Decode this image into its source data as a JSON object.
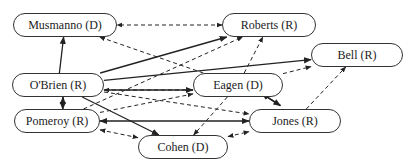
{
  "diagram": {
    "nodes": [
      {
        "id": "musmanno",
        "label": "Musmanno (D)",
        "x": 13,
        "y": 13,
        "w": 104,
        "h": 24
      },
      {
        "id": "roberts",
        "label": "Roberts (R)",
        "x": 222,
        "y": 13,
        "w": 94,
        "h": 24
      },
      {
        "id": "bell",
        "label": "Bell (R)",
        "x": 311,
        "y": 43,
        "w": 92,
        "h": 24
      },
      {
        "id": "obrien",
        "label": "O'Brien (R)",
        "x": 12,
        "y": 73,
        "w": 92,
        "h": 24
      },
      {
        "id": "eagen",
        "label": "Eagen (D)",
        "x": 193,
        "y": 73,
        "w": 90,
        "h": 24
      },
      {
        "id": "pomeroy",
        "label": "Pomeroy (R)",
        "x": 14,
        "y": 109,
        "w": 86,
        "h": 24
      },
      {
        "id": "jones",
        "label": "Jones (R)",
        "x": 249,
        "y": 109,
        "w": 92,
        "h": 24
      },
      {
        "id": "cohen",
        "label": "Cohen (D)",
        "x": 138,
        "y": 135,
        "w": 90,
        "h": 24
      }
    ],
    "edges": [
      {
        "from": "obrien",
        "to": "musmanno",
        "style": "solid",
        "dir": "forward"
      },
      {
        "from": "roberts",
        "to": "musmanno",
        "style": "dashed",
        "dir": "both"
      },
      {
        "from": "eagen",
        "to": "musmanno",
        "style": "dashed",
        "dir": "forward"
      },
      {
        "from": "obrien",
        "to": "roberts",
        "style": "solid",
        "dir": "forward"
      },
      {
        "from": "obrien",
        "to": "bell",
        "style": "solid",
        "dir": "forward"
      },
      {
        "from": "obrien",
        "to": "eagen",
        "style": "solid",
        "dir": "forward"
      },
      {
        "from": "eagen",
        "to": "obrien",
        "style": "dashed",
        "dir": "forward"
      },
      {
        "from": "obrien",
        "to": "pomeroy",
        "style": "solid",
        "dir": "forward"
      },
      {
        "from": "pomeroy",
        "to": "obrien",
        "style": "solid",
        "dir": "forward"
      },
      {
        "from": "obrien",
        "to": "cohen",
        "style": "solid",
        "dir": "forward"
      },
      {
        "from": "obrien",
        "to": "jones",
        "style": "dashed",
        "dir": "forward"
      },
      {
        "from": "pomeroy",
        "to": "roberts",
        "style": "dashed",
        "dir": "forward"
      },
      {
        "from": "pomeroy",
        "to": "eagen",
        "style": "dashed",
        "dir": "forward"
      },
      {
        "from": "pomeroy",
        "to": "jones",
        "style": "solid",
        "dir": "both"
      },
      {
        "from": "pomeroy",
        "to": "cohen",
        "style": "dashed",
        "dir": "both"
      },
      {
        "from": "eagen",
        "to": "roberts",
        "style": "dashed",
        "dir": "forward"
      },
      {
        "from": "eagen",
        "to": "bell",
        "style": "dashed",
        "dir": "forward"
      },
      {
        "from": "eagen",
        "to": "jones",
        "style": "solid",
        "dir": "forward"
      },
      {
        "from": "jones",
        "to": "eagen",
        "style": "solid",
        "dir": "forward"
      },
      {
        "from": "eagen",
        "to": "cohen",
        "style": "dashed",
        "dir": "forward"
      },
      {
        "from": "jones",
        "to": "bell",
        "style": "dashed",
        "dir": "forward"
      },
      {
        "from": "cohen",
        "to": "jones",
        "style": "dashed",
        "dir": "both"
      }
    ]
  }
}
